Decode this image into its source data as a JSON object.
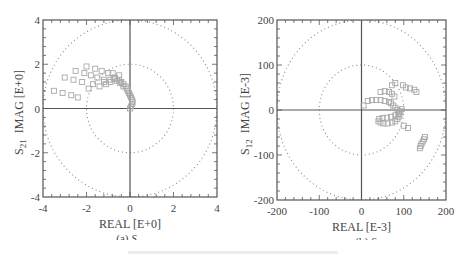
{
  "chart_data": [
    {
      "type": "scatter",
      "subtype": "polar-smith-style",
      "title": "",
      "caption": "(a) S21",
      "caption_label": "(a)",
      "caption_symbol": "S",
      "caption_sub": "21",
      "xlabel": "REAL [E+0]",
      "ylabel": "IMAG [E+0]",
      "ylabel_prefix": "S_21",
      "xlim": [
        -4,
        4
      ],
      "ylim": [
        -4,
        4
      ],
      "xticks": [
        "-4",
        "-2",
        "0",
        "2",
        "4"
      ],
      "yticks": [
        "4",
        "2",
        "0",
        "-2",
        "-4"
      ],
      "grid": false,
      "reference_circles": [
        2,
        4
      ],
      "marker": "open-square",
      "marker_color": "#aaaaaa",
      "x": [
        -3.5,
        -3.1,
        -2.7,
        -2.4,
        -3.0,
        -2.6,
        -2.2,
        -1.9,
        -2.5,
        -2.1,
        -1.8,
        -1.5,
        -1.2,
        -2.0,
        -1.6,
        -1.3,
        -1.0,
        -0.8,
        -1.7,
        -1.4,
        -1.1,
        -0.9,
        -0.7,
        -0.5,
        -1.2,
        -0.9,
        -0.7,
        -0.5,
        -0.4,
        -0.3,
        -0.2,
        -0.15,
        -0.1,
        -0.05,
        0.0,
        0.05,
        0.1,
        0.12,
        0.1,
        0.05,
        0.0,
        -0.3,
        -0.45,
        -0.6,
        -0.75
      ],
      "y": [
        0.8,
        0.7,
        0.6,
        0.5,
        1.4,
        1.3,
        1.2,
        0.9,
        1.7,
        1.6,
        1.5,
        1.4,
        1.3,
        1.9,
        1.8,
        1.7,
        1.6,
        1.6,
        1.1,
        1.0,
        1.1,
        1.2,
        1.4,
        1.5,
        1.2,
        1.3,
        1.35,
        1.3,
        1.2,
        1.1,
        1.0,
        0.9,
        0.8,
        0.7,
        0.6,
        0.5,
        0.4,
        0.3,
        0.2,
        0.1,
        0.0,
        1.0,
        1.15,
        1.25,
        1.35
      ]
    },
    {
      "type": "scatter",
      "subtype": "polar-smith-style",
      "title": "",
      "caption": "(b) S12",
      "caption_label": "(b)",
      "caption_symbol": "S",
      "caption_sub": "12",
      "xlabel": "REAL [E-3]",
      "ylabel": "IMAG [E-3]",
      "ylabel_prefix": "S_12",
      "xlim": [
        -200,
        200
      ],
      "ylim": [
        -200,
        200
      ],
      "xticks": [
        "-200",
        "-100",
        "0",
        "100",
        "200"
      ],
      "yticks": [
        "200",
        "100",
        "0",
        "-100",
        "-200"
      ],
      "grid": false,
      "reference_circles": [
        100,
        200
      ],
      "marker": "open-square",
      "marker_color": "#aaaaaa",
      "x": [
        5,
        15,
        25,
        35,
        45,
        55,
        65,
        70,
        75,
        80,
        85,
        88,
        90,
        88,
        85,
        80,
        72,
        62,
        52,
        45,
        40,
        42,
        50,
        60,
        70,
        80,
        88,
        92,
        95,
        72,
        80,
        98,
        105,
        115,
        125,
        130,
        100,
        110,
        150,
        148,
        145,
        142,
        140,
        138,
        45,
        55,
        65,
        72,
        78
      ],
      "y": [
        10,
        20,
        22,
        22,
        22,
        20,
        18,
        15,
        10,
        5,
        0,
        -5,
        -10,
        -15,
        -20,
        -25,
        -28,
        -30,
        -30,
        -28,
        -25,
        -20,
        -18,
        -17,
        -15,
        -12,
        -8,
        -3,
        2,
        55,
        60,
        55,
        50,
        48,
        45,
        40,
        -35,
        -40,
        -60,
        -65,
        -70,
        -75,
        -80,
        -85,
        40,
        42,
        40,
        36,
        30
      ]
    }
  ],
  "figure": {
    "panels": [
      {
        "id": "a",
        "caption_label": "(a)",
        "caption_symbol": "S",
        "caption_sub": "21"
      },
      {
        "id": "b",
        "caption_label": "(b)",
        "caption_symbol": "S",
        "caption_sub": "12"
      }
    ],
    "colors": {
      "axis": "#555555",
      "marker": "#a8a8a8",
      "circle": "#8a8a8a",
      "text": "#444444"
    }
  }
}
